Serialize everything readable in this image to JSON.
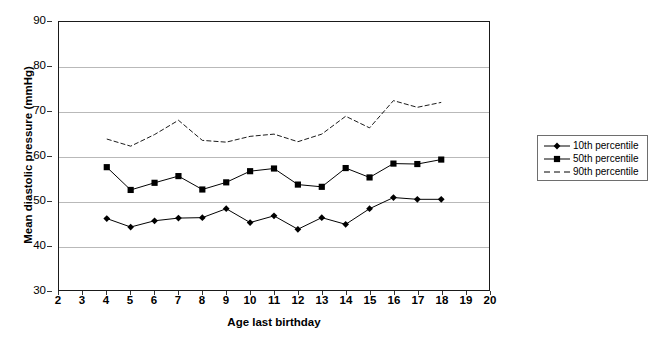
{
  "chart_data": {
    "type": "line",
    "title": "",
    "xlabel": "Age last birthday",
    "ylabel": "Mean diastolic pressure (mmHg)",
    "xlim": [
      2,
      20
    ],
    "ylim": [
      30,
      90
    ],
    "xticks": [
      2,
      3,
      4,
      5,
      6,
      7,
      8,
      9,
      10,
      11,
      12,
      13,
      14,
      15,
      16,
      17,
      18,
      19,
      20
    ],
    "yticks": [
      30,
      40,
      50,
      60,
      70,
      80,
      90
    ],
    "grid": "horizontal",
    "legend_position": "right",
    "x": [
      4,
      5,
      6,
      7,
      8,
      9,
      10,
      11,
      12,
      13,
      14,
      15,
      16,
      17,
      18
    ],
    "series": [
      {
        "name": "10th percentile",
        "marker": "diamond",
        "line_style": "solid",
        "color": "#000000",
        "values": [
          46.0,
          44.1,
          45.5,
          46.1,
          46.2,
          48.2,
          45.1,
          46.6,
          43.6,
          46.2,
          44.7,
          48.2,
          50.7,
          50.3,
          50.3
        ]
      },
      {
        "name": "50th percentile",
        "marker": "square",
        "line_style": "solid",
        "color": "#000000",
        "values": [
          57.5,
          52.4,
          54.0,
          55.5,
          52.5,
          54.1,
          56.6,
          57.2,
          53.6,
          53.1,
          57.3,
          55.2,
          58.3,
          58.2,
          59.2
        ]
      },
      {
        "name": "90th percentile",
        "marker": "none",
        "line_style": "dashed",
        "color": "#000000",
        "values": [
          63.8,
          62.2,
          64.8,
          68.0,
          63.5,
          63.1,
          64.4,
          64.9,
          63.2,
          64.9,
          68.9,
          66.3,
          72.4,
          70.9,
          72.0
        ]
      }
    ]
  },
  "axes": {
    "y_title": "Mean diastolic pressure (mmHg)",
    "x_title": "Age last birthday",
    "y_tick_labels": [
      "90",
      "80",
      "70",
      "60",
      "50",
      "40",
      "30"
    ],
    "x_tick_labels": [
      "2",
      "3",
      "4",
      "5",
      "6",
      "7",
      "8",
      "9",
      "10",
      "11",
      "12",
      "13",
      "14",
      "15",
      "16",
      "17",
      "18",
      "19",
      "20"
    ]
  },
  "legend": {
    "entries": [
      {
        "label": "10th percentile",
        "marker": "diamond",
        "line_style": "solid"
      },
      {
        "label": "50th percentile",
        "marker": "square",
        "line_style": "solid"
      },
      {
        "label": "90th percentile",
        "marker": "none",
        "line_style": "dashed"
      }
    ]
  },
  "colors": {
    "ink": "#000000",
    "grid": "#b9b9b9",
    "frame": "#1a1a1a",
    "legend_border": "#6e6e6e",
    "background": "#ffffff"
  }
}
